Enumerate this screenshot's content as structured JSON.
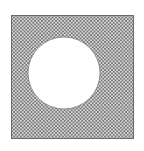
{
  "figure": {
    "square": {
      "x": 11.5,
      "y": 15.5,
      "width": 122,
      "height": 123,
      "stroke": "#6a6a6a",
      "stroke_width": 1
    },
    "hole": {
      "cx": 64,
      "cy": 73,
      "r": 36,
      "fill": "#ffffff",
      "stroke": "#7a7a7a"
    },
    "hatch": {
      "spacing": 3.5,
      "color": "#707070",
      "line_width": 0.9,
      "angles": [
        45,
        -45
      ]
    }
  }
}
